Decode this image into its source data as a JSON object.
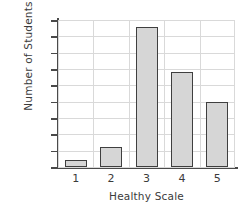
{
  "chart_data": {
    "type": "bar",
    "title": "",
    "categories": [
      "1",
      "2",
      "3",
      "4",
      "5"
    ],
    "values": [
      2,
      6,
      43,
      29,
      20
    ],
    "series": [
      {
        "name": "Number of Students",
        "values": [
          2,
          6,
          43,
          29,
          20
        ]
      }
    ],
    "xlabel": "Healthy Scale",
    "ylabel": "Number of Students",
    "ylim": [
      0,
      45
    ],
    "xlim": [
      0.5,
      5.5
    ],
    "ytick_labels": [
      "0",
      "5",
      "10",
      "15",
      "20",
      "25",
      "30",
      "35",
      "40",
      "45"
    ],
    "ytick_values": [
      0,
      5,
      10,
      15,
      20,
      25,
      30,
      35,
      40,
      45
    ],
    "xtick_labels": [
      "1",
      "2",
      "3",
      "4",
      "5"
    ],
    "grid": true,
    "legend": false,
    "legend_position": "none",
    "colors": {
      "bar_fill": "#d6d6d6",
      "bar_edge": "#3f3f3f",
      "grid": "#d9d9d9",
      "axis": "#4a4a4a",
      "text": "#3b3b3b",
      "background": "#ffffff"
    }
  }
}
